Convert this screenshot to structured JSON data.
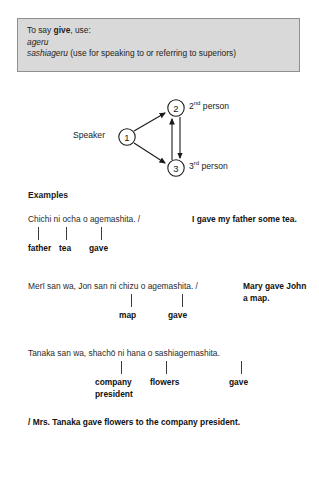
{
  "info_box": {
    "line1_prefix": "To say ",
    "line1_bold": "give",
    "line1_suffix": ", use:",
    "line2": "ageru",
    "line3_italic": "sashiageru",
    "line3_rest": " (use for speaking to or referring to superiors)"
  },
  "diagram": {
    "speaker_label": "Speaker",
    "node1": "1",
    "node2": "2",
    "node3": "3",
    "second_person_number": "2",
    "second_person_ordinal": "nd",
    "second_person_text": " person",
    "third_person_number": "3",
    "third_person_ordinal": "rd",
    "third_person_text": " person",
    "arrow_color": "#1a1a1a"
  },
  "examples_heading": "Examples",
  "examples": [
    {
      "romaji": "Chichi ni ocha o agemashita. /",
      "translation": "I gave my father some tea.",
      "glosses": [
        "father",
        "tea",
        "gave"
      ]
    },
    {
      "romaji": "Merī san wa, Jon san ni chizu o agemashita. /",
      "translation": "Mary gave John a map.",
      "glosses": [
        "map",
        "gave"
      ]
    },
    {
      "romaji": "Tanaka san wa, shachō ni hana o     sashiagemashita.",
      "translation": "/ Mrs. Tanaka gave flowers to the company president.",
      "glosses": [
        "company president",
        "flowers",
        "gave"
      ]
    }
  ]
}
